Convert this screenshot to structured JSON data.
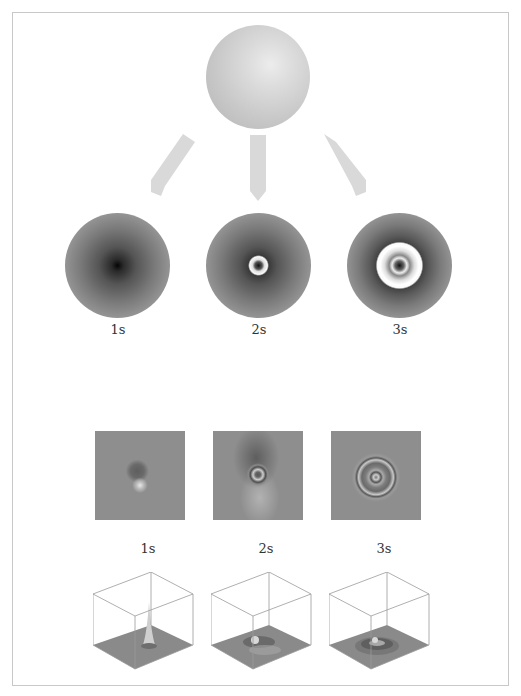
{
  "figure": {
    "top_object": {
      "name": "sphere",
      "color": "#cfcfcf"
    },
    "arrows": [
      {
        "direction": "down-left",
        "color": "#d9d9d9"
      },
      {
        "direction": "down",
        "color": "#d9d9d9"
      },
      {
        "direction": "down-right",
        "color": "#d9d9d9"
      }
    ],
    "row1": {
      "panels": [
        {
          "id": "disk-1s",
          "label": "1s"
        },
        {
          "id": "disk-2s",
          "label": "2s"
        },
        {
          "id": "disk-3s",
          "label": "3s"
        }
      ]
    },
    "row2": {
      "panels": [
        {
          "id": "map-1s",
          "label": "1s"
        },
        {
          "id": "map-2s",
          "label": "2s"
        },
        {
          "id": "map-3s",
          "label": "3s"
        }
      ]
    },
    "row3": {
      "panels": [
        {
          "id": "surface-1s"
        },
        {
          "id": "surface-2s"
        },
        {
          "id": "surface-3s"
        }
      ]
    },
    "colors": {
      "frame_border": "#c8c8c8",
      "panel_gray": "#8e8e8e",
      "cube_line": "#9a9a9a"
    }
  }
}
